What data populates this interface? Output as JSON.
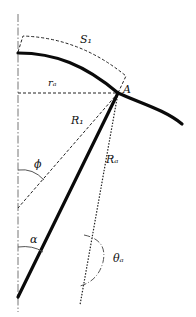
{
  "diagram": {
    "title": "",
    "labels": {
      "S1": "S₁",
      "rA": "rₐ",
      "A": "A",
      "R1": "R₁",
      "phi": "ϕ",
      "RA": "Rₐ",
      "alpha": "α",
      "thetaA": "θₐ"
    },
    "elements": [
      "vertical-axis (dash-dot)",
      "thick-curve through point A",
      "thick-straight-line from axis bottom to A",
      "arc S1 (dashed) above curve",
      "horizontal radius rA (dashed)",
      "line R1 (dashed) to axis",
      "line RA (dotted) downward",
      "angle phi between axis and R1",
      "angle alpha between axis and thick line",
      "angle thetaA at RA line"
    ],
    "colors": {
      "stroke": "#111111",
      "axis": "#777777",
      "background": "#ffffff"
    }
  }
}
